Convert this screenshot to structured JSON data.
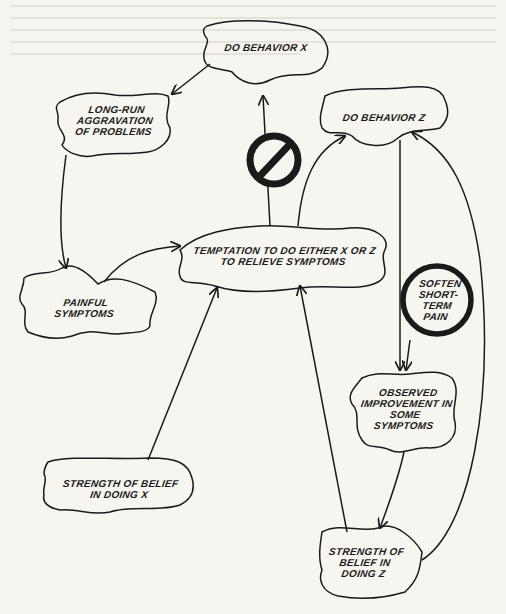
{
  "diagram": {
    "nodes": [
      {
        "id": "do_x",
        "lines": [
          "DO BEHAVIOR X"
        ]
      },
      {
        "id": "aggravation",
        "lines": [
          "LONG-RUN",
          "AGGRAVATION",
          "OF PROBLEMS"
        ]
      },
      {
        "id": "do_z",
        "lines": [
          "DO BEHAVIOR Z"
        ]
      },
      {
        "id": "temptation",
        "lines": [
          "TEMPTATION TO DO EITHER X OR Z",
          "TO RELIEVE SYMPTOMS"
        ]
      },
      {
        "id": "painful",
        "lines": [
          "PAINFUL",
          "SYMPTOMS"
        ]
      },
      {
        "id": "soften",
        "lines": [
          "SOFTEN",
          "SHORT-",
          "TERM",
          "PAIN"
        ]
      },
      {
        "id": "improvement",
        "lines": [
          "OBSERVED",
          "IMPROVEMENT IN",
          "SOME",
          "SYMPTOMS"
        ]
      },
      {
        "id": "belief_x",
        "lines": [
          "STRENGTH OF BELIEF",
          "IN DOING X"
        ]
      },
      {
        "id": "belief_z",
        "lines": [
          "STRENGTH OF",
          "BELIEF IN",
          "DOING Z"
        ]
      }
    ],
    "edges": [
      {
        "from": "do_x",
        "to": "aggravation"
      },
      {
        "from": "aggravation",
        "to": "painful"
      },
      {
        "from": "painful",
        "to": "temptation"
      },
      {
        "from": "temptation",
        "to": "do_x",
        "blocked": true
      },
      {
        "from": "temptation",
        "to": "do_z"
      },
      {
        "from": "do_z",
        "to": "improvement"
      },
      {
        "from": "soften",
        "to": "improvement"
      },
      {
        "from": "improvement",
        "to": "belief_z"
      },
      {
        "from": "belief_z",
        "to": "temptation"
      },
      {
        "from": "belief_z",
        "to": "do_z"
      },
      {
        "from": "belief_x",
        "to": "temptation"
      }
    ],
    "symbols": {
      "prohibition": "no-entry-icon",
      "soften_ring": "circle-ring"
    },
    "colors": {
      "ink": "#1a1a1a",
      "paper": "#f7f5f0"
    }
  }
}
